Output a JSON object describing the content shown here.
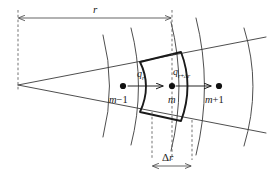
{
  "diagram": {
    "colors": {
      "line": "#3a3a3a",
      "bold_line": "#1a1a1a",
      "dashed_line": "#5a5a5a",
      "node_dot": "#111111",
      "background": "#ffffff",
      "text": "#1a1a1a"
    },
    "nodes": [
      {
        "label_main": "m",
        "label_op": "−",
        "label_suffix": "1",
        "x": 123,
        "y": 86,
        "name": "node-m-minus-1"
      },
      {
        "label_main": "m",
        "label_op": "",
        "label_suffix": "",
        "x": 172,
        "y": 86,
        "name": "node-m"
      },
      {
        "label_main": "m",
        "label_op": "+",
        "label_suffix": "1",
        "x": 219,
        "y": 86,
        "name": "node-m-plus-1"
      }
    ],
    "flux_labels": [
      {
        "symbol": "q",
        "sub_main": "r",
        "sub_op": "",
        "sub_extra": "",
        "name": "flux-q-r"
      },
      {
        "symbol": "q",
        "sub_main": "r",
        "sub_op": "+",
        "sub_extra": "Δr",
        "name": "flux-q-r-plus-delta-r"
      }
    ],
    "dimensions": [
      {
        "label": "r",
        "name": "dimension-r",
        "from_x": 18,
        "to_x": 172,
        "y": 18
      },
      {
        "label": "Δr",
        "name": "dimension-delta-r",
        "from_x": 152,
        "to_x": 192,
        "y": 166
      }
    ],
    "arcs": [
      {
        "name": "arc-inner-1",
        "radius_x": 105
      },
      {
        "name": "arc-face-left",
        "radius_x": 134
      },
      {
        "name": "arc-face-right",
        "radius_x": 174
      },
      {
        "name": "arc-outer-1",
        "radius_x": 198
      },
      {
        "name": "arc-outer-2",
        "radius_x": 246
      }
    ],
    "wedge": {
      "name": "wedge-rays",
      "apex_x": 18,
      "apex_y": 85,
      "half_angle_deg": 11
    }
  }
}
